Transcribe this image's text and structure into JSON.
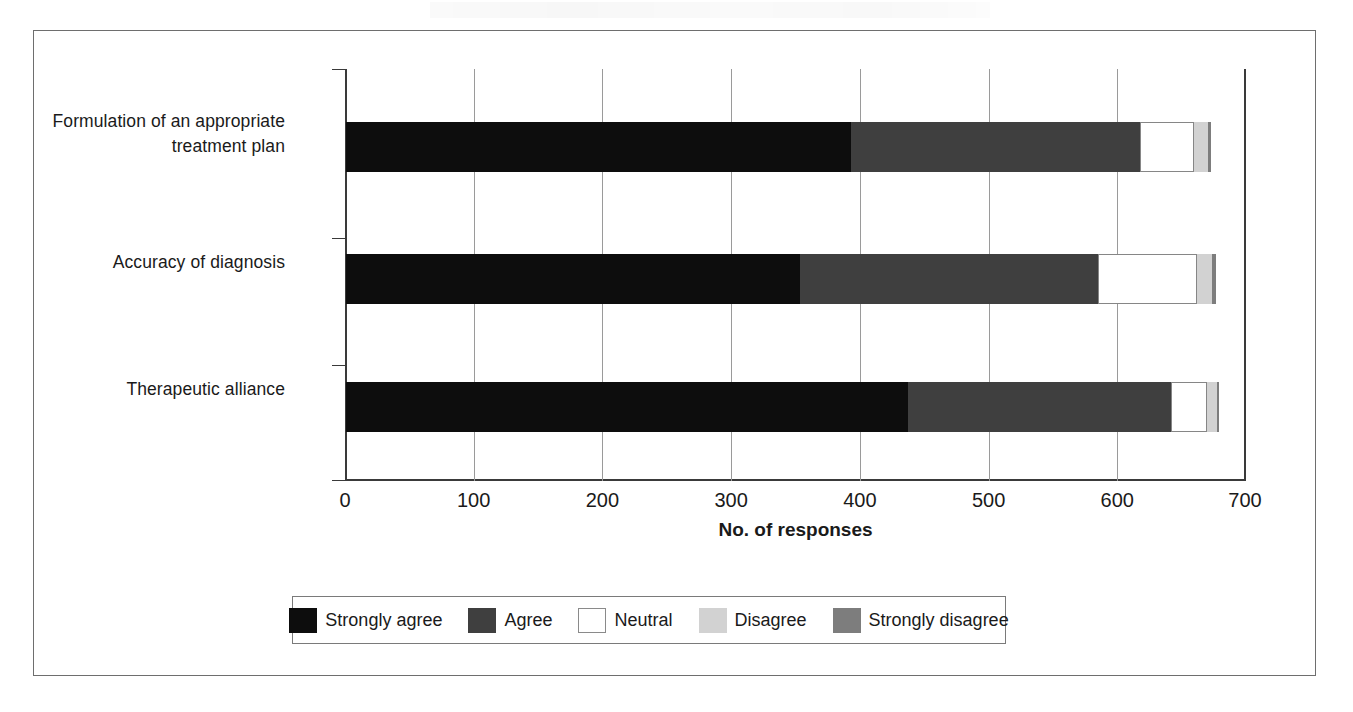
{
  "chart_data": {
    "type": "bar",
    "orientation": "horizontal",
    "stacked": true,
    "title": "",
    "xlabel": "No. of responses",
    "ylabel": "",
    "xlim": [
      0,
      700
    ],
    "ylim": null,
    "grid": true,
    "legend_position": "bottom",
    "xticks": [
      0,
      100,
      200,
      300,
      400,
      500,
      600,
      700
    ],
    "xtick_labels": [
      "0",
      "100",
      "200",
      "300",
      "400",
      "500",
      "600",
      "700"
    ],
    "categories": [
      "Formulation of an appropriate treatment plan",
      "Accuracy of diagnosis",
      "Therapeutic alliance"
    ],
    "category_lines": [
      [
        "Formulation of an appropriate",
        "treatment plan"
      ],
      [
        "Accuracy of diagnosis"
      ],
      [
        "Therapeutic alliance"
      ]
    ],
    "series": [
      {
        "name": "Strongly agree",
        "color": "#0d0d0d",
        "values": [
          392,
          353,
          437
        ]
      },
      {
        "name": "Agree",
        "color": "#3f3f3f",
        "values": [
          225,
          231,
          204
        ]
      },
      {
        "name": "Neutral",
        "color": "#ffffff",
        "values": [
          42,
          77,
          28
        ]
      },
      {
        "name": "Disagree",
        "color": "#d2d2d2",
        "values": [
          11,
          12,
          8
        ]
      },
      {
        "name": "Strongly disagree",
        "color": "#7d7d7d",
        "values": [
          2,
          3,
          1
        ]
      }
    ],
    "totals": [
      672,
      676,
      678
    ]
  },
  "legend": {
    "items": [
      {
        "label": "Strongly agree",
        "swatch": "sa"
      },
      {
        "label": "Agree",
        "swatch": "a"
      },
      {
        "label": "Neutral",
        "swatch": "n"
      },
      {
        "label": "Disagree",
        "swatch": "d"
      },
      {
        "label": "Strongly disagree",
        "swatch": "sd"
      }
    ]
  },
  "axis": {
    "x_title": "No. of responses"
  },
  "colors": {
    "strongly_agree": "#0d0d0d",
    "agree": "#3f3f3f",
    "neutral": "#ffffff",
    "disagree": "#d2d2d2",
    "strongly_disagree": "#7d7d7d",
    "frame": "#6e6e6e",
    "grid": "#9a9a9a",
    "axis": "#3a3a3a"
  }
}
